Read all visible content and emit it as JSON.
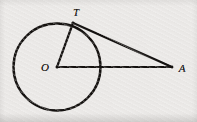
{
  "figure": {
    "width": 197,
    "height": 122,
    "background_color": "#eeecea",
    "ink_color": "#14110f"
  },
  "labels": {
    "center": "O",
    "tangent_point": "T",
    "external_point": "A"
  },
  "chart_data": {
    "type": "diagram",
    "background": "#eeecea",
    "stroke_color": "#14110f",
    "points": [
      {
        "name": "O",
        "label": "O",
        "role": "circle-center",
        "x": 57,
        "y": 67,
        "label_x": 45,
        "label_y": 67
      },
      {
        "name": "T",
        "label": "T",
        "role": "tangent-point",
        "x": 73,
        "y": 23,
        "label_x": 76,
        "label_y": 12
      },
      {
        "name": "A",
        "label": "A",
        "role": "external-point",
        "x": 172,
        "y": 67,
        "label_x": 182,
        "label_y": 68
      }
    ],
    "shapes": [
      {
        "name": "circle",
        "type": "circle",
        "cx": 57,
        "cy": 67,
        "r": 43.5,
        "stroke_width": 2.4,
        "fill": "none"
      },
      {
        "name": "segment-OT",
        "type": "line",
        "from": "O",
        "to": "T",
        "stroke_width": 2.2
      },
      {
        "name": "segment-OA",
        "type": "line",
        "from": "O",
        "to": "A",
        "stroke_width": 2.2
      },
      {
        "name": "segment-TA",
        "type": "line",
        "from": "T",
        "to": "A",
        "stroke_width": 2.4
      }
    ],
    "annotations": [
      "OT is a radius of the circle",
      "TA is tangent to the circle at T",
      "OA passes through the circle and ends at external point A"
    ],
    "label_font_size": 11
  }
}
